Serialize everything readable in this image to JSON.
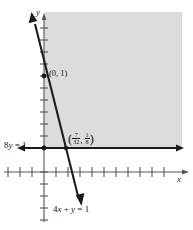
{
  "figure": {
    "type": "cartesian-graph",
    "background_color": "#ffffff",
    "shade_color": "#dcdcdc",
    "ink_color": "#1a1a1a"
  },
  "axes": {
    "x_label": "x",
    "y_label": "y",
    "origin_px": [
      44,
      160
    ],
    "tick_spacing_px": 12,
    "x_ticks_left": 3,
    "x_ticks_right": 11,
    "y_ticks_up": 11,
    "y_ticks_down": 5,
    "x_arrow": "right",
    "y_arrow": "up"
  },
  "lines": [
    {
      "name": "slanted-line",
      "equation_text": "4x + y = 1",
      "equation_parts": {
        "coef": "4",
        "xvar": "x",
        "plus": " + ",
        "yvar": "y",
        "eq": " = ",
        "rhs": "1"
      },
      "label_position": "below-axis",
      "arrows": "both",
      "from_px": [
        32,
        19
      ],
      "to_px": [
        80,
        200
      ]
    },
    {
      "name": "horizontal-line",
      "equation_text": "8y = 1",
      "equation_parts": {
        "coef": "8",
        "yvar": "y",
        "eq": " = ",
        "rhs": "1"
      },
      "label_position": "left",
      "arrows": "both",
      "y_value_px": 148
    }
  ],
  "points": [
    {
      "name": "y-intercept",
      "label_text": "(0, 1)",
      "x_text": "0",
      "y_text": "1",
      "position_px": [
        46,
        74
      ]
    },
    {
      "name": "intersection-point",
      "label_text": "(7/32, 1/8)",
      "x_num": "7",
      "x_den": "32",
      "y_num": "1",
      "y_den": "8",
      "position_px": [
        69,
        148
      ]
    }
  ],
  "region": {
    "name": "solution-region",
    "fill": "#dcdcdc",
    "bounds_px": {
      "left": 44,
      "top": 12,
      "right": 182,
      "bottom": 148
    }
  }
}
